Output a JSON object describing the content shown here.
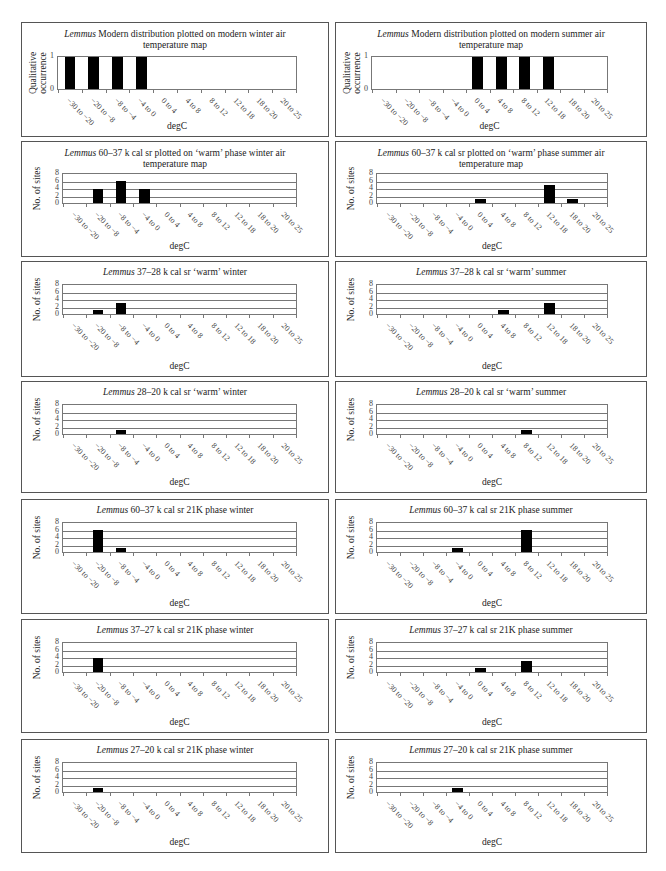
{
  "categories": [
    "−30 to −20",
    "−20 to −8",
    "−8 to −4",
    "−4 to 0",
    "0 to 4",
    "4 to 8",
    "8 to 12",
    "12 to 18",
    "18 to 20",
    "20 to 25"
  ],
  "xlabel": "degC",
  "chart_data": [
    {
      "type": "bar",
      "title_italic": "Lemmus",
      "title": "Modern distribution plotted on modern winter air temperature map",
      "xlabel": "degC",
      "ylabel": "Qualitative occurrence",
      "ylim": [
        0,
        1
      ],
      "yticks": [
        0,
        1
      ],
      "grid": false,
      "categories": [
        "−30 to −20",
        "−20 to −8",
        "−8 to −4",
        "−4 to 0",
        "0 to 4",
        "4 to 8",
        "8 to 12",
        "12 to 18",
        "18 to 20",
        "20 to 25"
      ],
      "values": [
        1,
        1,
        1,
        1,
        0,
        0,
        0,
        0,
        0,
        0
      ]
    },
    {
      "type": "bar",
      "title_italic": "Lemmus",
      "title": "Modern distribution plotted on modern summer air temperature map",
      "xlabel": "degC",
      "ylabel": "Qualitative occurrence",
      "ylim": [
        0,
        1
      ],
      "yticks": [
        0,
        1
      ],
      "grid": false,
      "categories": [
        "−30 to −20",
        "−20 to −8",
        "−8 to −4",
        "−4 to 0",
        "0 to 4",
        "4 to 8",
        "8 to 12",
        "12 to 18",
        "18 to 20",
        "20 to 25"
      ],
      "values": [
        0,
        0,
        0,
        0,
        1,
        1,
        1,
        1,
        0,
        0
      ]
    },
    {
      "type": "bar",
      "title_italic": "Lemmus",
      "title": "60–37 k cal sr plotted on ‘warm’ phase winter air temperature map",
      "xlabel": "degC",
      "ylabel": "No. of sites",
      "ylim": [
        0,
        8
      ],
      "yticks": [
        0,
        2,
        4,
        6,
        8
      ],
      "grid": true,
      "categories": [
        "−30 to −20",
        "−20 to −8",
        "−8 to −4",
        "−4 to 0",
        "0 to 4",
        "4 to 8",
        "8 to 12",
        "12 to 18",
        "18 to 20",
        "20 to 25"
      ],
      "values": [
        0,
        4,
        6,
        4,
        0,
        0,
        0,
        0,
        0,
        0
      ]
    },
    {
      "type": "bar",
      "title_italic": "Lemmus",
      "title": "60–37 k cal sr plotted on ‘warm’ phase summer air temperature map",
      "xlabel": "degC",
      "ylabel": "No. of sites",
      "ylim": [
        0,
        8
      ],
      "yticks": [
        0,
        2,
        4,
        6,
        8
      ],
      "grid": true,
      "categories": [
        "−30 to −20",
        "−20 to −8",
        "−8 to −4",
        "−4 to 0",
        "0 to 4",
        "4 to 8",
        "8 to 12",
        "12 to 18",
        "18 to 20",
        "20 to 25"
      ],
      "values": [
        0,
        0,
        0,
        0,
        1,
        0,
        0,
        5,
        1,
        0
      ]
    },
    {
      "type": "bar",
      "title_italic": "Lemmus",
      "title": "37–28 k cal sr ‘warm’ winter",
      "xlabel": "degC",
      "ylabel": "No. of sites",
      "ylim": [
        0,
        8
      ],
      "yticks": [
        0,
        2,
        4,
        6,
        8
      ],
      "grid": true,
      "categories": [
        "−30 to −20",
        "−20 to −8",
        "−8 to −4",
        "−4 to 0",
        "0 to 4",
        "4 to 8",
        "8 to 12",
        "12 to 18",
        "18 to 20",
        "20 to 25"
      ],
      "values": [
        0,
        1,
        3,
        0,
        0,
        0,
        0,
        0,
        0,
        0
      ]
    },
    {
      "type": "bar",
      "title_italic": "Lemmus",
      "title": "37–28 k cal sr ‘warm’ summer",
      "xlabel": "degC",
      "ylabel": "No. of sites",
      "ylim": [
        0,
        8
      ],
      "yticks": [
        0,
        2,
        4,
        6,
        8
      ],
      "grid": true,
      "categories": [
        "−30 to −20",
        "−20 to −8",
        "−8 to −4",
        "−4 to 0",
        "0 to 4",
        "4 to 8",
        "8 to 12",
        "12 to 18",
        "18 to 20",
        "20 to 25"
      ],
      "values": [
        0,
        0,
        0,
        0,
        0,
        1,
        0,
        3,
        0,
        0
      ]
    },
    {
      "type": "bar",
      "title_italic": "Lemmus",
      "title": "28–20 k cal sr ‘warm’ winter",
      "xlabel": "degC",
      "ylabel": "No. of sites",
      "ylim": [
        0,
        8
      ],
      "yticks": [
        0,
        2,
        4,
        6,
        8
      ],
      "grid": true,
      "categories": [
        "−30 to −20",
        "−20 to −8",
        "−8 to −4",
        "−4 to 0",
        "0 to 4",
        "4 to 8",
        "8 to 12",
        "12 to 18",
        "18 to 20",
        "20 to 25"
      ],
      "values": [
        0,
        0,
        1,
        0,
        0,
        0,
        0,
        0,
        0,
        0
      ]
    },
    {
      "type": "bar",
      "title_italic": "Lemmus",
      "title": "28–20 k cal sr ‘warm’ summer",
      "xlabel": "degC",
      "ylabel": "No. of sites",
      "ylim": [
        0,
        8
      ],
      "yticks": [
        0,
        2,
        4,
        6,
        8
      ],
      "grid": true,
      "categories": [
        "−30 to −20",
        "−20 to −8",
        "−8 to −4",
        "−4 to 0",
        "0 to 4",
        "4 to 8",
        "8 to 12",
        "12 to 18",
        "18 to 20",
        "20 to 25"
      ],
      "values": [
        0,
        0,
        0,
        0,
        0,
        0,
        1,
        0,
        0,
        0
      ]
    },
    {
      "type": "bar",
      "title_italic": "Lemmus",
      "title": "60–37 k cal sr 21K phase winter",
      "xlabel": "degC",
      "ylabel": "No. of sites",
      "ylim": [
        0,
        8
      ],
      "yticks": [
        0,
        2,
        4,
        6,
        8
      ],
      "grid": true,
      "categories": [
        "−30 to −20",
        "−20 to −8",
        "−8 to −4",
        "−4 to 0",
        "0 to 4",
        "4 to 8",
        "8 to 12",
        "12 to 18",
        "18 to 20",
        "20 to 25"
      ],
      "values": [
        0,
        6,
        1,
        0,
        0,
        0,
        0,
        0,
        0,
        0
      ]
    },
    {
      "type": "bar",
      "title_italic": "Lemmus",
      "title": "60–37 k cal sr 21K phase summer",
      "xlabel": "degC",
      "ylabel": "No. of sites",
      "ylim": [
        0,
        8
      ],
      "yticks": [
        0,
        2,
        4,
        6,
        8
      ],
      "grid": true,
      "categories": [
        "−30 to −20",
        "−20 to −8",
        "−8 to −4",
        "−4 to 0",
        "0 to 4",
        "4 to 8",
        "8 to 12",
        "12 to 18",
        "18 to 20",
        "20 to 25"
      ],
      "values": [
        0,
        0,
        0,
        1,
        0,
        0,
        6,
        0,
        0,
        0
      ]
    },
    {
      "type": "bar",
      "title_italic": "Lemmus",
      "title": "37–27 k cal sr 21K phase winter",
      "xlabel": "degC",
      "ylabel": "No. of sites",
      "ylim": [
        0,
        8
      ],
      "yticks": [
        0,
        2,
        4,
        6,
        8
      ],
      "grid": true,
      "categories": [
        "−30 to −20",
        "−20 to −8",
        "−8 to −4",
        "−4 to 0",
        "0 to 4",
        "4 to 8",
        "8 to 12",
        "12 to 18",
        "18 to 20",
        "20 to 25"
      ],
      "values": [
        0,
        4,
        0,
        0,
        0,
        0,
        0,
        0,
        0,
        0
      ]
    },
    {
      "type": "bar",
      "title_italic": "Lemmus",
      "title": "37–27 k cal sr 21K phase summer",
      "xlabel": "degC",
      "ylabel": "No. of sites",
      "ylim": [
        0,
        8
      ],
      "yticks": [
        0,
        2,
        4,
        6,
        8
      ],
      "grid": true,
      "categories": [
        "−30 to −20",
        "−20 to −8",
        "−8 to −4",
        "−4 to 0",
        "0 to 4",
        "4 to 8",
        "8 to 12",
        "12 to 18",
        "18 to 20",
        "20 to 25"
      ],
      "values": [
        0,
        0,
        0,
        0,
        1,
        0,
        3,
        0,
        0,
        0
      ]
    },
    {
      "type": "bar",
      "title_italic": "Lemmus",
      "title": "27–20 k cal sr 21K phase winter",
      "xlabel": "degC",
      "ylabel": "No. of sites",
      "ylim": [
        0,
        8
      ],
      "yticks": [
        0,
        2,
        4,
        6,
        8
      ],
      "grid": true,
      "categories": [
        "−30 to −20",
        "−20 to −8",
        "−8 to −4",
        "−4 to 0",
        "0 to 4",
        "4 to 8",
        "8 to 12",
        "12 to 18",
        "18 to 20",
        "20 to 25"
      ],
      "values": [
        0,
        1,
        0,
        0,
        0,
        0,
        0,
        0,
        0,
        0
      ]
    },
    {
      "type": "bar",
      "title_italic": "Lemmus",
      "title": "27–20 k cal sr 21K phase summer",
      "xlabel": "degC",
      "ylabel": "No. of sites",
      "ylim": [
        0,
        8
      ],
      "yticks": [
        0,
        2,
        4,
        6,
        8
      ],
      "grid": true,
      "categories": [
        "−30 to −20",
        "−20 to −8",
        "−8 to −4",
        "−4 to 0",
        "0 to 4",
        "4 to 8",
        "8 to 12",
        "12 to 18",
        "18 to 20",
        "20 to 25"
      ],
      "values": [
        0,
        0,
        0,
        1,
        0,
        0,
        0,
        0,
        0,
        0
      ]
    }
  ]
}
